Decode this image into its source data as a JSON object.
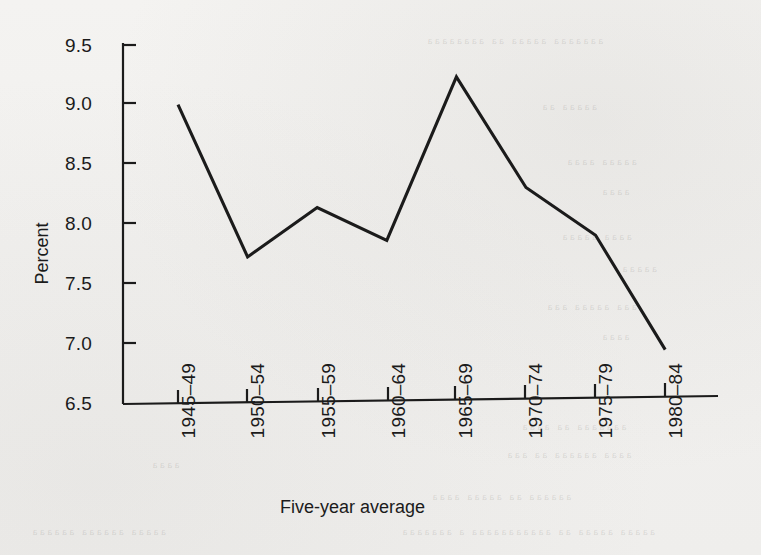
{
  "chart_data": {
    "type": "line",
    "title": "",
    "subtitle": "",
    "xlabel": "Five-year average",
    "ylabel": "Percent",
    "categories": [
      "1945–49",
      "1950–54",
      "1955–59",
      "1960–64",
      "1965–69",
      "1970–74",
      "1975–79",
      "1980–84"
    ],
    "values": [
      9.0,
      7.72,
      8.13,
      7.85,
      9.23,
      8.29,
      7.88,
      6.9
    ],
    "series": [
      {
        "name": "Percent",
        "values": [
          9.0,
          7.72,
          8.13,
          7.85,
          9.23,
          8.29,
          7.88,
          6.9
        ]
      }
    ],
    "ylim": [
      6.5,
      9.5
    ],
    "yticks": [
      9.5,
      9.0,
      8.5,
      8.0,
      7.5,
      7.0,
      6.5
    ],
    "ytick_labels": [
      "9.5",
      "9.0",
      "8.5",
      "8.0",
      "7.5",
      "7.0",
      "6.5"
    ],
    "grid": false,
    "legend": false,
    "legend_position": "none",
    "line_color": "#1b1b1b",
    "markers": false,
    "axis_color": "#1b1b1b",
    "background_color": "#f2f1ef"
  },
  "axes": {
    "y_label": "Percent",
    "x_label": "Five-year average"
  }
}
